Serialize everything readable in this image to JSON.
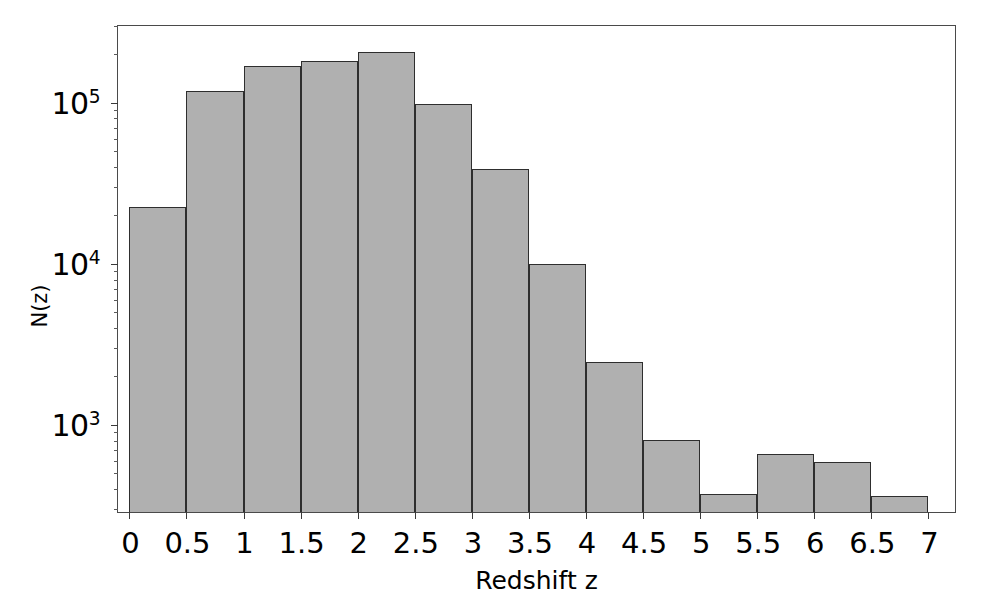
{
  "chart_data": {
    "type": "bar",
    "title": "",
    "subtitle": "",
    "xlabel": "Redshift z",
    "ylabel": "N(z)",
    "yscale": "log",
    "xlim": [
      -0.1,
      7.25
    ],
    "ylim": [
      280,
      300000
    ],
    "grid": false,
    "legend": null,
    "bar_style": {
      "fill": "#b0b0b0",
      "edge": "#2e2e2e",
      "edge_width": 1.6
    },
    "bin_edges": [
      0,
      0.5,
      1,
      1.5,
      2,
      2.5,
      3,
      3.5,
      4,
      4.5,
      5,
      5.5,
      6,
      6.5,
      7
    ],
    "categories": [
      "0-0.5",
      "0.5-1",
      "1-1.5",
      "1.5-2",
      "2-2.5",
      "2.5-3",
      "3-3.5",
      "3.5-4",
      "4-4.5",
      "4.5-5",
      "5-5.5",
      "5.5-6",
      "6-6.5",
      "6.5-7"
    ],
    "bin_centers": [
      0.25,
      0.75,
      1.25,
      1.75,
      2.25,
      2.75,
      3.25,
      3.75,
      4.25,
      4.75,
      5.25,
      5.75,
      6.25,
      6.75
    ],
    "values": [
      22000,
      115000,
      165000,
      178000,
      200000,
      95000,
      38000,
      9700,
      2400,
      780,
      360,
      640,
      570,
      350
    ],
    "xticks": [
      0,
      0.5,
      1,
      1.5,
      2,
      2.5,
      3,
      3.5,
      4,
      4.5,
      5,
      5.5,
      6,
      6.5,
      7
    ],
    "xtick_labels": [
      "0",
      "0.5",
      "1",
      "1.5",
      "2",
      "2.5",
      "3",
      "3.5",
      "4",
      "4.5",
      "5",
      "5.5",
      "6",
      "6.5",
      "7"
    ],
    "yticks": [
      1000,
      10000,
      100000
    ],
    "ytick_labels": [
      {
        "mantissa": "10",
        "exponent": "3"
      },
      {
        "mantissa": "10",
        "exponent": "4"
      },
      {
        "mantissa": "10",
        "exponent": "5"
      }
    ],
    "yticks_minor": [
      2000,
      3000,
      4000,
      5000,
      6000,
      7000,
      8000,
      9000,
      20000,
      30000,
      40000,
      50000,
      60000,
      70000,
      80000,
      90000,
      200000,
      300000,
      900,
      800,
      700,
      600,
      500,
      400,
      300
    ]
  },
  "figure": {
    "background": "#ffffff",
    "frame_color": "#4a4a4a"
  }
}
